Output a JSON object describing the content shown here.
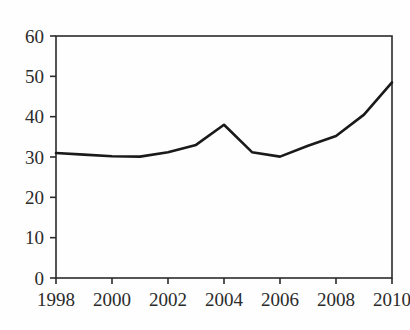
{
  "chart_data": {
    "type": "line",
    "title": "",
    "subtitle": "",
    "xlabel": "",
    "ylabel": "",
    "xlim": [
      1998,
      2010
    ],
    "ylim": [
      0,
      60
    ],
    "grid": false,
    "legend": false,
    "legend_position": "none",
    "line_color": "#1a1a1a",
    "background_color": "#fefefe",
    "axis_color": "#2b2b2b",
    "x": [
      1998,
      1999,
      2000,
      2001,
      2002,
      2003,
      2004,
      2005,
      2006,
      2007,
      2008,
      2009,
      2010
    ],
    "values": [
      31,
      30.6,
      30.2,
      30.1,
      31.2,
      33,
      38,
      31.2,
      30.1,
      32.8,
      35.2,
      40.5,
      48.5
    ],
    "series": [
      {
        "name": "",
        "values": [
          31,
          30.6,
          30.2,
          30.1,
          31.2,
          33,
          38,
          31.2,
          30.1,
          32.8,
          35.2,
          40.5,
          48.5
        ]
      }
    ],
    "y_ticks": [
      0,
      10,
      20,
      30,
      40,
      50,
      60
    ],
    "y_tick_labels": [
      "0",
      "10",
      "20",
      "30",
      "40",
      "50",
      "60"
    ],
    "x_ticks": [
      1998,
      2000,
      2002,
      2004,
      2006,
      2008,
      2010
    ],
    "x_tick_labels": [
      "1998",
      "2000",
      "2002",
      "2004",
      "2006",
      "2008",
      "2010"
    ]
  }
}
